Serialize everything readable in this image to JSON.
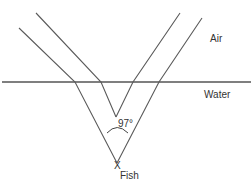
{
  "labels": {
    "air": "Air",
    "water": "Water",
    "angle": "97°",
    "fish": "Fish",
    "fish_marker": "X"
  },
  "colors": {
    "line": "#5a5a5a",
    "surface": "#555555",
    "text": "#333333",
    "background": "#ffffff"
  },
  "geometry": {
    "surface_y": 82,
    "fish": [
      117,
      163
    ],
    "virtual_apex": [
      116,
      117
    ],
    "outer_left_ray": [
      [
        19,
        28
      ],
      [
        75,
        82
      ],
      [
        117,
        163
      ]
    ],
    "inner_left_ray": [
      [
        36,
        13
      ],
      [
        101,
        82
      ],
      [
        116,
        117
      ]
    ],
    "inner_right_ray": [
      [
        180,
        13
      ],
      [
        133,
        82
      ],
      [
        116,
        117
      ]
    ],
    "outer_right_ray": [
      [
        202,
        18
      ],
      [
        159,
        82
      ],
      [
        117,
        163
      ]
    ]
  }
}
